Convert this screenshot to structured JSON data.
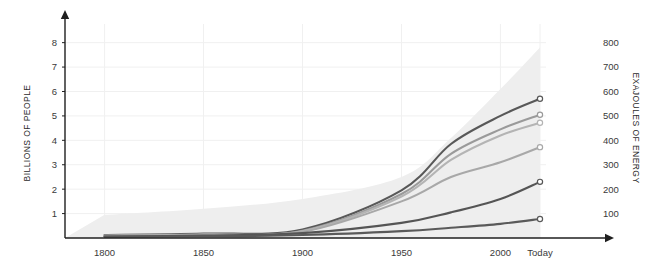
{
  "chart_data": {
    "type": "line",
    "title": "",
    "subtitle": "",
    "grid": true,
    "legend": "none",
    "x": [
      1800,
      1850,
      1900,
      1950,
      1975,
      2000,
      2020
    ],
    "xlabel": "",
    "xtick_labels": [
      "1800",
      "1850",
      "1900",
      "1950",
      "2000",
      "Today"
    ],
    "xtick_values": [
      1800,
      1850,
      1900,
      1950,
      2000,
      2020
    ],
    "xlim": [
      1780,
      2020
    ],
    "left_axis": {
      "label": "BILLIONS OF PEOPLE",
      "ticks": [
        1,
        2,
        3,
        4,
        5,
        6,
        7,
        8
      ],
      "tick_labels": [
        "1",
        "2",
        "3",
        "4",
        "5",
        "6",
        "7",
        "8"
      ],
      "lim": [
        0,
        8.6
      ]
    },
    "right_axis": {
      "label": "EXAJOULES OF ENERGY",
      "ticks": [
        100,
        200,
        300,
        400,
        500,
        600,
        700,
        800
      ],
      "tick_labels": [
        "100",
        "200",
        "300",
        "400",
        "500",
        "600",
        "700",
        "800"
      ],
      "lim": [
        0,
        860
      ]
    },
    "area": {
      "name": "world-population-band",
      "color": "#eeeeee",
      "values": [
        0.95,
        1.2,
        1.6,
        2.5,
        4.1,
        6.1,
        7.8
      ]
    },
    "series": [
      {
        "name": "series-1",
        "color": "#585858",
        "width": 2.1,
        "end_marker": true,
        "values": [
          0.12,
          0.18,
          0.35,
          1.95,
          3.85,
          5.0,
          5.7
        ]
      },
      {
        "name": "series-2",
        "color": "#9a9a9a",
        "width": 2.1,
        "end_marker": true,
        "values": [
          0.1,
          0.15,
          0.3,
          1.8,
          3.45,
          4.45,
          5.05
        ]
      },
      {
        "name": "series-3",
        "color": "#b4b4b4",
        "width": 2.1,
        "end_marker": true,
        "values": [
          0.09,
          0.14,
          0.28,
          1.7,
          3.2,
          4.2,
          4.72
        ]
      },
      {
        "name": "series-4",
        "color": "#a8a8a8",
        "width": 2.1,
        "end_marker": true,
        "values": [
          0.08,
          0.12,
          0.25,
          1.5,
          2.5,
          3.1,
          3.72
        ]
      },
      {
        "name": "series-5",
        "color": "#555555",
        "width": 2.1,
        "end_marker": true,
        "values": [
          0.06,
          0.1,
          0.2,
          0.62,
          1.05,
          1.6,
          2.3
        ]
      },
      {
        "name": "series-6",
        "color": "#5a5a5a",
        "width": 2.1,
        "end_marker": true,
        "values": [
          0.05,
          0.07,
          0.12,
          0.28,
          0.42,
          0.58,
          0.78
        ]
      }
    ]
  },
  "colors": {
    "axis": "#1f1f1f",
    "grid": "#f0f0f0",
    "band": "#eeeeee",
    "text": "#333333"
  }
}
